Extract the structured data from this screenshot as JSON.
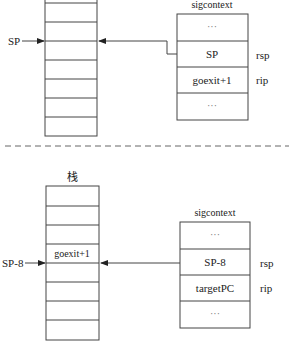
{
  "top_panel": {
    "stack": {
      "label": "",
      "rows": [
        "",
        "",
        "",
        "",
        "",
        "",
        "",
        ""
      ],
      "pointer_label": "SP"
    },
    "sigcontext": {
      "title": "sigcontext",
      "rows": [
        {
          "value": "···",
          "register": ""
        },
        {
          "value": "SP",
          "register": "rsp"
        },
        {
          "value": "goexit+1",
          "register": "rip"
        },
        {
          "value": "···",
          "register": ""
        }
      ]
    }
  },
  "divider": "dashed",
  "bottom_panel": {
    "stack": {
      "label": "栈",
      "rows": [
        "",
        "",
        "",
        "goexit+1",
        "",
        "",
        "",
        ""
      ],
      "pointer_label": "SP-8"
    },
    "sigcontext": {
      "title": "sigcontext",
      "rows": [
        {
          "value": "···",
          "register": ""
        },
        {
          "value": "SP-8",
          "register": "rsp"
        },
        {
          "value": "targetPC",
          "register": "rip"
        },
        {
          "value": "···",
          "register": ""
        }
      ]
    }
  }
}
